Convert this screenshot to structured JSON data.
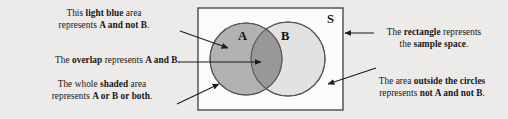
{
  "figure": {
    "kind": "venn-diagram",
    "background_color": "#ecebe9"
  },
  "diagram": {
    "sample_space_label": "S",
    "set_a_label": "A",
    "set_b_label": "B",
    "rectangle": {
      "x": 198,
      "y": 8,
      "width": 145,
      "height": 102,
      "stroke": "#4a4a4a",
      "fill": "#fbfbfa"
    },
    "circle_a": {
      "cx": 246,
      "cy": 59,
      "r": 36,
      "fill": "#b2b2b2",
      "stroke": "#555555"
    },
    "circle_b": {
      "cx": 288,
      "cy": 59,
      "r": 37,
      "fill": "#e2e2e2",
      "stroke": "#555555"
    },
    "overlap_fill": "#989898"
  },
  "annotations": [
    {
      "id": "light-blue",
      "align": "center",
      "lines": [
        [
          {
            "t": "This ",
            "em": false
          },
          {
            "t": "light blue",
            "em": true
          },
          {
            "t": " area",
            "em": false
          }
        ],
        [
          {
            "t": "represents ",
            "em": false
          },
          {
            "t": "A and not B",
            "em": true
          },
          {
            "t": ".",
            "em": false
          }
        ]
      ]
    },
    {
      "id": "overlap",
      "align": "right",
      "lines": [
        [
          {
            "t": "The ",
            "em": false
          },
          {
            "t": "overlap",
            "em": true
          },
          {
            "t": " represents ",
            "em": false
          },
          {
            "t": "A and B",
            "em": true
          },
          {
            "t": ".",
            "em": false
          }
        ]
      ]
    },
    {
      "id": "shaded",
      "align": "center",
      "lines": [
        [
          {
            "t": "The whole ",
            "em": false
          },
          {
            "t": "shaded",
            "em": true
          },
          {
            "t": " area",
            "em": false
          }
        ],
        [
          {
            "t": "represents ",
            "em": false
          },
          {
            "t": "A or B or both",
            "em": true
          },
          {
            "t": ".",
            "em": false
          }
        ]
      ]
    },
    {
      "id": "rectangle",
      "align": "center",
      "lines": [
        [
          {
            "t": "The ",
            "em": false
          },
          {
            "t": "rectangle",
            "em": true
          },
          {
            "t": " represents",
            "em": false
          }
        ],
        [
          {
            "t": "the ",
            "em": false
          },
          {
            "t": "sample space",
            "em": true
          },
          {
            "t": ".",
            "em": false
          }
        ]
      ]
    },
    {
      "id": "outside",
      "align": "center",
      "lines": [
        [
          {
            "t": "The area ",
            "em": false
          },
          {
            "t": "outside the circles",
            "em": true
          }
        ],
        [
          {
            "t": "represents ",
            "em": false
          },
          {
            "t": "not A and not B",
            "em": true
          },
          {
            "t": ".",
            "em": false
          }
        ]
      ]
    }
  ],
  "leader_lines": [
    {
      "name": "leader-light-blue",
      "x1": 180,
      "y1": 31,
      "x2": 228,
      "y2": 48,
      "arrow": "end"
    },
    {
      "name": "leader-overlap",
      "x1": 178,
      "y1": 62,
      "x2": 261,
      "y2": 62,
      "arrow": "end"
    },
    {
      "name": "leader-shaded",
      "x1": 177,
      "y1": 104,
      "x2": 219,
      "y2": 84,
      "arrow": "end"
    },
    {
      "name": "leader-rectangle",
      "x1": 374,
      "y1": 33,
      "x2": 345,
      "y2": 33,
      "arrow": "end"
    },
    {
      "name": "leader-outside",
      "x1": 376,
      "y1": 68,
      "x2": 328,
      "y2": 84,
      "arrow": "end"
    }
  ]
}
